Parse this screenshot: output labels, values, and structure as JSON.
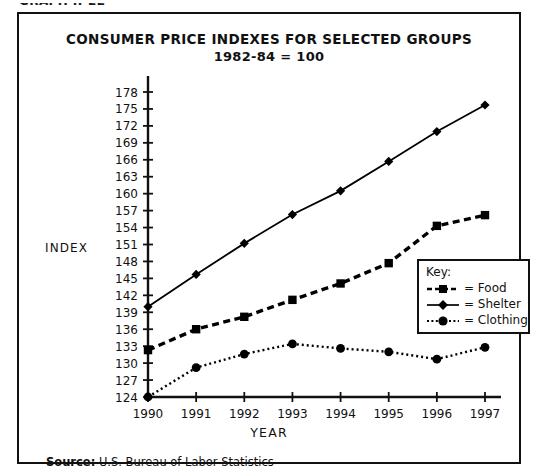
{
  "figure": {
    "graph_number": "GRAPH II-22",
    "title_line_1": "CONSUMER PRICE INDEXES FOR SELECTED GROUPS",
    "title_line_2": "1982-84 = 100",
    "source_prefix": "Source:",
    "source_text": "U.S. Bureau of Labor Statistics"
  },
  "legend": {
    "heading": "Key:",
    "entries": [
      {
        "label": "= Food",
        "style": "dashed",
        "marker": "square"
      },
      {
        "label": "= Shelter",
        "style": "solid",
        "marker": "diamond"
      },
      {
        "label": "= Clothing",
        "style": "dotted",
        "marker": "circle"
      }
    ]
  },
  "chart_data": {
    "type": "line",
    "title": "CONSUMER PRICE INDEXES FOR SELECTED GROUPS 1982-84 = 100",
    "xlabel": "YEAR",
    "ylabel": "INDEX",
    "x": [
      1990,
      1991,
      1992,
      1993,
      1994,
      1995,
      1996,
      1997
    ],
    "xtick_labels": [
      "1990",
      "1991",
      "1992",
      "1993",
      "1994",
      "1995",
      "1996",
      "1997"
    ],
    "ylim": [
      124,
      178
    ],
    "ytick_values": [
      124,
      127,
      130,
      133,
      136,
      139,
      142,
      145,
      148,
      151,
      154,
      157,
      160,
      163,
      166,
      169,
      172,
      175,
      178
    ],
    "ytick_labels": [
      "124",
      "127",
      "130",
      "133",
      "136",
      "139",
      "142",
      "145",
      "148",
      "151",
      "154",
      "157",
      "160",
      "163",
      "166",
      "169",
      "172",
      "175",
      "178"
    ],
    "grid": false,
    "legend_position": "center-right",
    "series": [
      {
        "name": "Food",
        "marker": "square",
        "dash": "dashed",
        "color": "#000000",
        "values": [
          132.3,
          136.0,
          138.2,
          141.2,
          144.1,
          147.7,
          154.3,
          156.2
        ]
      },
      {
        "name": "Shelter",
        "marker": "diamond",
        "dash": "solid",
        "color": "#000000",
        "values": [
          140.0,
          145.7,
          151.2,
          156.3,
          160.5,
          165.7,
          171.0,
          175.7
        ]
      },
      {
        "name": "Clothing",
        "marker": "circle",
        "dash": "dotted",
        "color": "#000000",
        "values": [
          124.0,
          129.2,
          131.6,
          133.4,
          132.6,
          132.0,
          130.7,
          132.8
        ]
      }
    ]
  }
}
